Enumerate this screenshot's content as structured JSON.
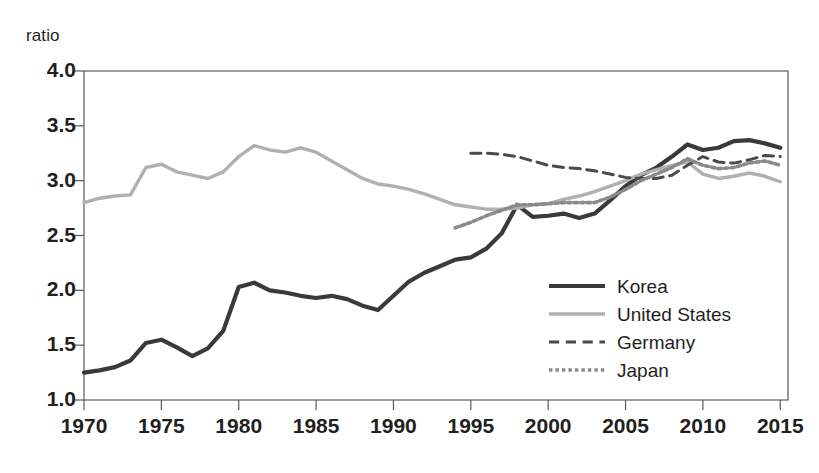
{
  "chart_data": {
    "type": "line",
    "title": "",
    "xlabel": "",
    "ylabel": "ratio",
    "ylim": [
      1.0,
      4.0
    ],
    "xlim": [
      1970,
      2015.5
    ],
    "yticks": [
      "1.0",
      "1.5",
      "2.0",
      "2.5",
      "3.0",
      "3.5",
      "4.0"
    ],
    "ytick_values": [
      1.0,
      1.5,
      2.0,
      2.5,
      3.0,
      3.5,
      4.0
    ],
    "xticks": [
      "1970",
      "1975",
      "1980",
      "1985",
      "1990",
      "1995",
      "2000",
      "2005",
      "2010",
      "2015"
    ],
    "xtick_values": [
      1970,
      1975,
      1980,
      1985,
      1990,
      1995,
      2000,
      2005,
      2010,
      2015
    ],
    "grid": false,
    "legend_position": "center-right",
    "series": [
      {
        "name": "Korea",
        "style": "solid",
        "color": "#3a3a3a",
        "width": 4.2,
        "x": [
          1970,
          1971,
          1972,
          1973,
          1974,
          1975,
          1976,
          1977,
          1978,
          1979,
          1980,
          1981,
          1982,
          1983,
          1984,
          1985,
          1986,
          1987,
          1988,
          1989,
          1990,
          1991,
          1992,
          1993,
          1994,
          1995,
          1996,
          1997,
          1998,
          1999,
          2000,
          2001,
          2002,
          2003,
          2004,
          2005,
          2006,
          2007,
          2008,
          2009,
          2010,
          2011,
          2012,
          2013,
          2014,
          2015
        ],
        "values": [
          1.25,
          1.27,
          1.3,
          1.36,
          1.52,
          1.55,
          1.48,
          1.4,
          1.47,
          1.63,
          2.03,
          2.07,
          2.0,
          1.98,
          1.95,
          1.93,
          1.95,
          1.92,
          1.86,
          1.82,
          1.95,
          2.08,
          2.16,
          2.22,
          2.28,
          2.3,
          2.38,
          2.52,
          2.78,
          2.67,
          2.68,
          2.7,
          2.66,
          2.7,
          2.82,
          2.95,
          3.05,
          3.12,
          3.22,
          3.33,
          3.28,
          3.3,
          3.36,
          3.37,
          3.34,
          3.3
        ]
      },
      {
        "name": "United States",
        "style": "solid",
        "color": "#b0b0b0",
        "width": 3.4,
        "x": [
          1970,
          1971,
          1972,
          1973,
          1974,
          1975,
          1976,
          1977,
          1978,
          1979,
          1980,
          1981,
          1982,
          1983,
          1984,
          1985,
          1986,
          1987,
          1988,
          1989,
          1990,
          1991,
          1992,
          1993,
          1994,
          1995,
          1996,
          1997,
          1998,
          1999,
          2000,
          2001,
          2002,
          2003,
          2004,
          2005,
          2006,
          2007,
          2008,
          2009,
          2010,
          2011,
          2012,
          2013,
          2014,
          2015
        ],
        "values": [
          2.8,
          2.84,
          2.86,
          2.87,
          3.12,
          3.15,
          3.08,
          3.05,
          3.02,
          3.08,
          3.22,
          3.32,
          3.28,
          3.26,
          3.3,
          3.26,
          3.18,
          3.1,
          3.02,
          2.97,
          2.95,
          2.92,
          2.88,
          2.83,
          2.78,
          2.76,
          2.74,
          2.74,
          2.75,
          2.78,
          2.79,
          2.83,
          2.86,
          2.9,
          2.95,
          3.0,
          3.06,
          3.1,
          3.14,
          3.17,
          3.06,
          3.02,
          3.04,
          3.07,
          3.04,
          2.99
        ]
      },
      {
        "name": "Germany",
        "style": "dashed",
        "color": "#4a4a4a",
        "width": 3.0,
        "x": [
          1995,
          1996,
          1997,
          1998,
          1999,
          2000,
          2001,
          2002,
          2003,
          2004,
          2005,
          2006,
          2007,
          2008,
          2009,
          2010,
          2011,
          2012,
          2013,
          2014,
          2015
        ],
        "values": [
          3.25,
          3.25,
          3.24,
          3.22,
          3.18,
          3.14,
          3.12,
          3.11,
          3.09,
          3.06,
          3.03,
          3.02,
          3.02,
          3.05,
          3.14,
          3.22,
          3.17,
          3.16,
          3.19,
          3.23,
          3.22
        ]
      },
      {
        "name": "Japan",
        "style": "dotted",
        "color": "#8a8a8a",
        "width": 3.6,
        "x": [
          1994,
          1995,
          1996,
          1997,
          1998,
          1999,
          2000,
          2001,
          2002,
          2003,
          2004,
          2005,
          2006,
          2007,
          2008,
          2009,
          2010,
          2011,
          2012,
          2013,
          2014,
          2015
        ],
        "values": [
          2.57,
          2.62,
          2.68,
          2.73,
          2.78,
          2.78,
          2.79,
          2.8,
          2.8,
          2.8,
          2.85,
          2.92,
          3.0,
          3.06,
          3.12,
          3.2,
          3.14,
          3.11,
          3.12,
          3.16,
          3.18,
          3.14
        ]
      }
    ]
  },
  "legend": {
    "items": [
      {
        "label": "Korea",
        "style": "solid-thick",
        "color": "#3a3a3a"
      },
      {
        "label": "United States",
        "style": "solid-light",
        "color": "#b0b0b0"
      },
      {
        "label": "Germany",
        "style": "dashed",
        "color": "#4a4a4a"
      },
      {
        "label": "Japan",
        "style": "dotted",
        "color": "#8a8a8a"
      }
    ]
  }
}
